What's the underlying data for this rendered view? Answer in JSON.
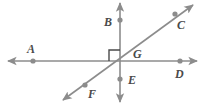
{
  "figure": {
    "background_color": "#ffffff",
    "line_color": "#8c8c8c",
    "point_color": "#8c8c8c",
    "label_color": "#4a4a4a",
    "right_angle_marker": {
      "present": true,
      "quadrant": "upper-left",
      "vertex": "G"
    }
  },
  "points": [
    {
      "id": "A",
      "label": "A",
      "cx": 33,
      "cy": 61,
      "label_x": 27,
      "label_y": 43
    },
    {
      "id": "B",
      "label": "B",
      "cx": 120,
      "cy": 20,
      "label_x": 104,
      "label_y": 16
    },
    {
      "id": "C",
      "label": "C",
      "cx": 175,
      "cy": 14,
      "label_x": 177,
      "label_y": 19
    },
    {
      "id": "D",
      "label": "D",
      "cx": 180,
      "cy": 61,
      "label_x": 175,
      "label_y": 68
    },
    {
      "id": "E",
      "label": "E",
      "cx": 120,
      "cy": 79,
      "label_x": 128,
      "label_y": 74
    },
    {
      "id": "F",
      "label": "F",
      "cx": 85,
      "cy": 85,
      "label_x": 88,
      "label_y": 88
    },
    {
      "id": "G",
      "label": "G",
      "cx": 120,
      "cy": 61,
      "label_x": 133,
      "label_y": 48
    }
  ],
  "lines": [
    {
      "id": "horizontal",
      "through": "A-G-D",
      "x1": 8,
      "y1": 61,
      "x2": 197,
      "y2": 61,
      "arrows": "both"
    },
    {
      "id": "vertical",
      "through": "B-G-E",
      "x1": 120,
      "y1": 3,
      "x2": 120,
      "y2": 102,
      "arrows": "both"
    },
    {
      "id": "diagonal",
      "through": "F-G-C",
      "x1": 63,
      "y1": 100,
      "x2": 193,
      "y2": 5,
      "arrows": "both"
    }
  ]
}
